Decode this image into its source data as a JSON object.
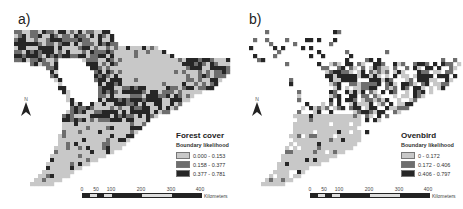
{
  "figure": {
    "panels": [
      {
        "label": "a)",
        "legend": {
          "title": "Forest cover",
          "subtitle": "Boundary likelihood",
          "classes": [
            {
              "label": "0.000 - 0.153",
              "color": "#c8c8c8"
            },
            {
              "label": "0.158 - 0.377",
              "color": "#6e6e6e"
            },
            {
              "label": "0.377 - 0.781",
              "color": "#262626"
            }
          ]
        }
      },
      {
        "label": "b)",
        "legend": {
          "title": "Ovenbird",
          "subtitle": "Boundary likelihood",
          "classes": [
            {
              "label": "0 - 0.172",
              "color": "#c8c8c8"
            },
            {
              "label": "0.172 - 0.406",
              "color": "#6e6e6e"
            },
            {
              "label": "0.406 - 0.797",
              "color": "#262626"
            }
          ]
        }
      }
    ],
    "north_arrow": {
      "label": "N"
    },
    "scale_bar": {
      "ticks": [
        "0",
        "50",
        "100",
        "200",
        "300",
        "400"
      ],
      "unit": "Kilometers"
    }
  }
}
